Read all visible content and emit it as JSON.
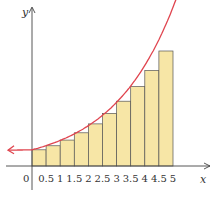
{
  "chart_data": {
    "type": "bar",
    "title": "",
    "xlabel": "x",
    "ylabel": "y",
    "categories": [
      "0",
      "0.5",
      "1",
      "1.5",
      "2",
      "2.5",
      "3",
      "3.5",
      "4",
      "4.5"
    ],
    "x_tick_labels": [
      "0",
      "0.5",
      "1",
      "1.5",
      "2",
      "2.5",
      "3",
      "3.5",
      "4",
      "4.5",
      "5"
    ],
    "values": [
      1.0,
      1.25,
      1.6,
      2.05,
      2.6,
      3.25,
      4.0,
      4.9,
      5.9,
      7.1
    ],
    "series": [
      {
        "name": "rectangles",
        "values": [
          1.0,
          1.25,
          1.6,
          2.05,
          2.6,
          3.25,
          4.0,
          4.9,
          5.9,
          7.1
        ]
      }
    ],
    "curve": "increasing exponential-like function, arrows at both ends",
    "xlim": [
      -0.5,
      5.5
    ],
    "grid": false,
    "colors": {
      "bar_fill": "#f7e6a6",
      "bar_edge": "#555555",
      "curve": "#e0454f",
      "axis": "#444444"
    }
  }
}
